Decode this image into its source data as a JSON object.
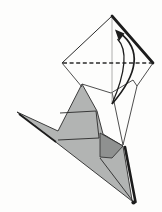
{
  "figure": {
    "canvas": {
      "width": 162,
      "height": 212,
      "background": "#fdfdfc"
    },
    "colors": {
      "line": "#2a2a2a",
      "thin_line": "#3a3a3a",
      "heavy_edge": "#1c1c1c",
      "crease_light": "#9b9b9b",
      "gray_fill": "#b2b4b3",
      "dark_gray_fill": "#8f9190",
      "white_fill": "#fdfdfc"
    },
    "shapes": [
      {
        "name": "model-body-gray",
        "type": "polygon",
        "fill": "#b2b4b3",
        "stroke": "#2a2a2a",
        "width": 0.9,
        "points": [
          [
            82,
            84
          ],
          [
            97,
            111
          ],
          [
            103,
            134
          ],
          [
            123,
            146
          ],
          [
            132,
            200
          ],
          [
            134.5,
            203
          ],
          [
            57,
            143
          ],
          [
            17,
            112
          ],
          [
            58,
            131
          ]
        ]
      },
      {
        "name": "model-dark-facet",
        "type": "polygon",
        "fill": "#8f9190",
        "stroke": "#2a2a2a",
        "width": 0.8,
        "points": [
          [
            100,
            133
          ],
          [
            123,
            146
          ],
          [
            112,
            158
          ],
          [
            100,
            157
          ]
        ]
      },
      {
        "name": "crease-upper-horizontal",
        "type": "line",
        "stroke": "#2a2a2a",
        "width": 0.9,
        "points": [
          [
            60,
            113
          ],
          [
            96,
            111
          ]
        ]
      },
      {
        "name": "crease-lower-horizontal",
        "type": "line",
        "stroke": "#2a2a2a",
        "width": 0.9,
        "points": [
          [
            58,
            140
          ],
          [
            99,
            138
          ]
        ]
      },
      {
        "name": "crease-vertical",
        "type": "line",
        "stroke": "#2a2a2a",
        "width": 0.9,
        "points": [
          [
            96,
            111
          ],
          [
            99,
            138
          ]
        ]
      },
      {
        "name": "crease-to-tip",
        "type": "line",
        "stroke": "#2a2a2a",
        "width": 0.9,
        "points": [
          [
            100,
            158
          ],
          [
            132,
            200
          ]
        ]
      },
      {
        "name": "spike-shadow-edge",
        "type": "line",
        "stroke": "#1c1c1c",
        "width": 1.7,
        "points": [
          [
            19,
            114
          ],
          [
            56,
            142
          ]
        ]
      },
      {
        "name": "back-layer-right-edge-upper",
        "type": "line",
        "stroke": "#3a3a3a",
        "width": 0.9,
        "points": [
          [
            153,
            63
          ],
          [
            137,
            86
          ]
        ]
      },
      {
        "name": "back-layer-right-edge-lower",
        "type": "line",
        "stroke": "#3a3a3a",
        "width": 0.9,
        "points": [
          [
            137,
            86
          ],
          [
            123,
            145
          ]
        ]
      },
      {
        "name": "back-layer-inner-crease",
        "type": "line",
        "stroke": "#3a3a3a",
        "width": 0.9,
        "points": [
          [
            112,
            92
          ],
          [
            123,
            145
          ]
        ]
      },
      {
        "name": "flap-bottom-edge-left",
        "type": "line",
        "stroke": "#3a3a3a",
        "width": 0.9,
        "points": [
          [
            82,
            84
          ],
          [
            111,
            93
          ]
        ]
      },
      {
        "name": "flap-bottom-edge-right",
        "type": "line",
        "stroke": "#3a3a3a",
        "width": 0.9,
        "points": [
          [
            111,
            93
          ],
          [
            133,
            80
          ]
        ]
      },
      {
        "name": "flap-bottom-corner",
        "type": "line",
        "stroke": "#3a3a3a",
        "width": 0.9,
        "points": [
          [
            133,
            80
          ],
          [
            137,
            86
          ]
        ]
      },
      {
        "name": "diamond-lower-left-edge",
        "type": "line",
        "stroke": "#3a3a3a",
        "width": 0.9,
        "points": [
          [
            62,
            63
          ],
          [
            82,
            87
          ]
        ]
      },
      {
        "name": "heavy-bottom-right-edge",
        "type": "line",
        "stroke": "#1c1c1c",
        "width": 2.6,
        "cap": "round",
        "points": [
          [
            125,
            147
          ],
          [
            135.5,
            202
          ]
        ]
      },
      {
        "name": "bottom-tip-blob",
        "type": "circle",
        "fill": "#1c1c1c",
        "cx": 133.5,
        "cy": 202.5,
        "r": 2.1
      },
      {
        "name": "center-crease",
        "type": "line",
        "stroke": "#9b9b9b",
        "width": 0.8,
        "points": [
          [
            112,
            17
          ],
          [
            112,
            103
          ]
        ]
      },
      {
        "name": "diamond-top-left-edge",
        "type": "line",
        "stroke": "#2a2a2a",
        "width": 1.0,
        "points": [
          [
            112,
            16
          ],
          [
            62,
            63
          ]
        ]
      },
      {
        "name": "diamond-top-right-heavy-edge",
        "type": "line",
        "stroke": "#1c1c1c",
        "width": 2.7,
        "cap": "round",
        "points": [
          [
            112,
            16
          ],
          [
            153,
            63
          ]
        ]
      },
      {
        "name": "valley-fold-dashed-line",
        "type": "line",
        "stroke": "#2a2a2a",
        "width": 1.5,
        "dash": "4 2.6",
        "points": [
          [
            63,
            63
          ],
          [
            152,
            63
          ]
        ]
      },
      {
        "name": "fold-arrow-outer-arc",
        "type": "path",
        "stroke": "#1c1c1c",
        "width": 1.7,
        "fill": "none",
        "d": "M 112 104 Q 152 57.5 120 33"
      },
      {
        "name": "fold-arrow-inner-arc",
        "type": "path",
        "stroke": "#1c1c1c",
        "width": 1.3,
        "fill": "none",
        "d": "M 112 104 Q 133 55 117.5 39"
      },
      {
        "name": "fold-arrow-head",
        "type": "polygon",
        "fill": "#1c1c1c",
        "stroke": "none",
        "width": 0,
        "points": [
          [
            115,
            29.5
          ],
          [
            124.5,
            33.5
          ],
          [
            119,
            41
          ]
        ]
      }
    ]
  }
}
